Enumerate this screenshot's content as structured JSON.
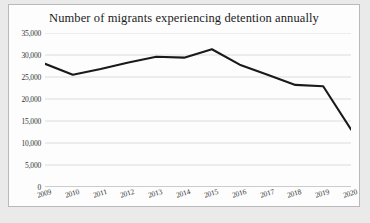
{
  "chart_data": {
    "type": "line",
    "title": "Number of migrants experiencing detention annually",
    "xlabel": "",
    "ylabel": "",
    "categories": [
      "2009",
      "2010",
      "2011",
      "2012",
      "2013",
      "2014",
      "2015",
      "2016",
      "2017",
      "2018",
      "2019",
      "2020"
    ],
    "values": [
      28000,
      25500,
      26800,
      28300,
      29600,
      29400,
      31300,
      27800,
      25500,
      23200,
      22900,
      13100
    ],
    "series": [
      {
        "name": "Migrants in detention",
        "values": [
          28000,
          25500,
          26800,
          28300,
          29600,
          29400,
          31300,
          27800,
          25500,
          23200,
          22900,
          13100
        ]
      }
    ],
    "ylim": [
      0,
      35000
    ],
    "ytick_values": [
      0,
      5000,
      10000,
      15000,
      20000,
      25000,
      30000,
      35000
    ],
    "ytick_labels": [
      "0",
      "5,000",
      "10,000",
      "15,000",
      "20,000",
      "25,000",
      "30,000",
      "35,000"
    ],
    "grid": true,
    "grid_axis": "y",
    "legend": false,
    "legend_position": "none",
    "line_color": "#1a1a1a",
    "grid_color": "#d8d8d8",
    "background_color": "#fdfdfd",
    "markers": false
  },
  "caption": {
    "text": ""
  }
}
